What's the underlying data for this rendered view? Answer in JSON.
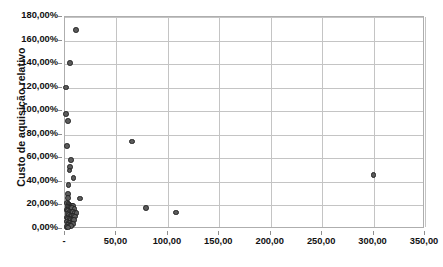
{
  "chart_data": {
    "type": "scatter",
    "title": "",
    "xlabel": "",
    "ylabel": "Custo de aquisição relativo",
    "xlim": [
      0,
      350
    ],
    "ylim": [
      0,
      1.8
    ],
    "grid": true,
    "legend": "none",
    "marker_color": "#5b5b5b",
    "marker_edge_color": "#232323",
    "x_tick_labels": [
      "-",
      "50,00",
      "100,00",
      "150,00",
      "200,00",
      "250,00",
      "300,00",
      "350,00"
    ],
    "x_tick_values": [
      0,
      50,
      100,
      150,
      200,
      250,
      300,
      350
    ],
    "y_tick_labels": [
      "0,00%",
      "20,00%",
      "40,00%",
      "60,00%",
      "80,00%",
      "100,00%",
      "120,00%",
      "140,00%",
      "160,00%",
      "180,00%"
    ],
    "y_tick_values": [
      0,
      0.2,
      0.4,
      0.6,
      0.8,
      1.0,
      1.2,
      1.4,
      1.6,
      1.8
    ],
    "points": [
      [
        10.5,
        1.69
      ],
      [
        5.0,
        1.41
      ],
      [
        0.8,
        1.2
      ],
      [
        1.2,
        0.975
      ],
      [
        3.0,
        0.915
      ],
      [
        2.2,
        0.705
      ],
      [
        65.0,
        0.742
      ],
      [
        6.0,
        0.585
      ],
      [
        4.6,
        0.525
      ],
      [
        4.2,
        0.495
      ],
      [
        8.4,
        0.435
      ],
      [
        3.6,
        0.375
      ],
      [
        3.2,
        0.295
      ],
      [
        3.0,
        0.265
      ],
      [
        14.5,
        0.258
      ],
      [
        2.0,
        0.222
      ],
      [
        3.4,
        0.213
      ],
      [
        4.4,
        0.205
      ],
      [
        5.6,
        0.2
      ],
      [
        6.8,
        0.198
      ],
      [
        8.0,
        0.196
      ],
      [
        2.6,
        0.186
      ],
      [
        4.0,
        0.182
      ],
      [
        5.2,
        0.178
      ],
      [
        7.0,
        0.176
      ],
      [
        9.2,
        0.172
      ],
      [
        79.0,
        0.178
      ],
      [
        108.0,
        0.14
      ],
      [
        1.8,
        0.162
      ],
      [
        3.0,
        0.156
      ],
      [
        4.8,
        0.15
      ],
      [
        6.2,
        0.146
      ],
      [
        7.6,
        0.143
      ],
      [
        9.6,
        0.14
      ],
      [
        11.0,
        0.137
      ],
      [
        2.4,
        0.126
      ],
      [
        3.8,
        0.12
      ],
      [
        5.4,
        0.116
      ],
      [
        6.6,
        0.112
      ],
      [
        8.2,
        0.11
      ],
      [
        10.0,
        0.106
      ],
      [
        1.6,
        0.096
      ],
      [
        3.2,
        0.09
      ],
      [
        4.6,
        0.086
      ],
      [
        6.0,
        0.082
      ],
      [
        7.4,
        0.078
      ],
      [
        9.0,
        0.074
      ],
      [
        2.0,
        0.062
      ],
      [
        3.6,
        0.056
      ],
      [
        5.0,
        0.052
      ],
      [
        6.4,
        0.048
      ],
      [
        8.0,
        0.044
      ],
      [
        2.8,
        0.034
      ],
      [
        4.2,
        0.028
      ],
      [
        5.8,
        0.024
      ],
      [
        1.4,
        0.018
      ],
      [
        3.0,
        0.014
      ],
      [
        300.0,
        0.458
      ]
    ]
  },
  "caption": {
    "text": ""
  }
}
